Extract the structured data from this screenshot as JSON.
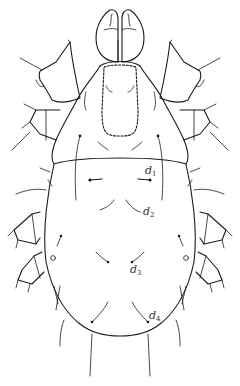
{
  "figure": {
    "line_color": "#1a1a1a",
    "background": "#ffffff",
    "labels": [
      {
        "id": "d1",
        "base": "d",
        "sub": "1"
      },
      {
        "id": "d2",
        "base": "d",
        "sub": "2"
      },
      {
        "id": "d3",
        "base": "d",
        "sub": "3"
      },
      {
        "id": "d4",
        "base": "d",
        "sub": "4"
      }
    ]
  }
}
